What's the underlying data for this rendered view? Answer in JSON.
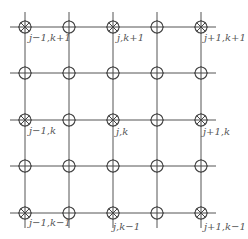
{
  "diagram": {
    "type": "finite-difference grid stencil",
    "columns_x": [
      25,
      69,
      113,
      157,
      201
    ],
    "rows_y": [
      27,
      73,
      120,
      166,
      213
    ],
    "h_line_extent": [
      10,
      216
    ],
    "v_line_extent": [
      12,
      228
    ],
    "node_radius": 6,
    "colors": {
      "line": "#555555",
      "node": "#444444",
      "label": "#555555",
      "background": "#ffffff"
    },
    "node_types": {
      "primary": "circle-with-x",
      "secondary": "circle-with-cross"
    },
    "primary_nodes": [
      {
        "col": 0,
        "row": 0,
        "label": "j−1,k+1"
      },
      {
        "col": 2,
        "row": 0,
        "label": "j,k+1"
      },
      {
        "col": 4,
        "row": 0,
        "label": "j+1,k+1"
      },
      {
        "col": 0,
        "row": 2,
        "label": "j−1,k"
      },
      {
        "col": 2,
        "row": 2,
        "label": "j,k"
      },
      {
        "col": 4,
        "row": 2,
        "label": "j+1,k"
      },
      {
        "col": 0,
        "row": 4,
        "label": "j−1,k−1"
      },
      {
        "col": 2,
        "row": 4,
        "label": "j,k−1"
      },
      {
        "col": 4,
        "row": 4,
        "label": "j+1,k−1"
      }
    ]
  },
  "labels": {
    "jm1_kp1": "j−1,k+1",
    "j_kp1": "j,k+1",
    "jp1_kp1": "j+1,k+1",
    "jm1_k": "j−1,k",
    "j_k": "j,k",
    "jp1_k": "j+1,k",
    "jm1_km1": "j−1,k−1",
    "j_km1": "j,k−1",
    "jp1_km1": "j+1,k−1"
  }
}
